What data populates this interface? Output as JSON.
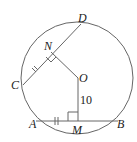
{
  "diagram": {
    "type": "circle-geometry",
    "points": {
      "D": "D",
      "N": "N",
      "C": "C",
      "O": "O",
      "A": "A",
      "M": "M",
      "B": "B"
    },
    "measurements": {
      "OM": "10"
    },
    "colors": {
      "stroke": "#555555",
      "text": "#222222"
    }
  }
}
